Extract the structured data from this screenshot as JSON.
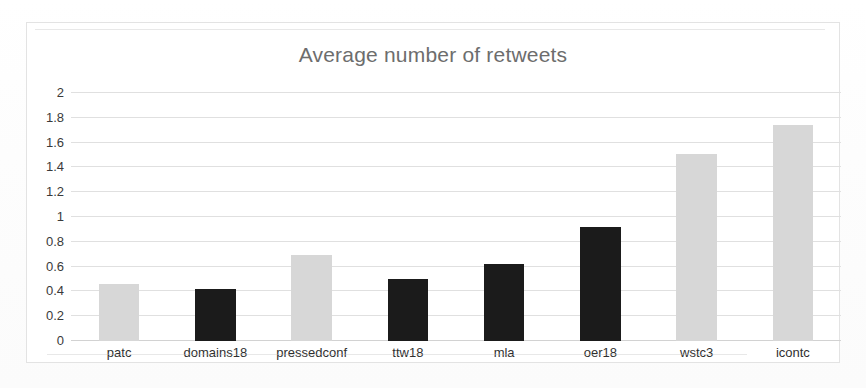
{
  "chart_data": {
    "type": "bar",
    "title": "Average number of retweets",
    "xlabel": "",
    "ylabel": "",
    "ylim": [
      0,
      2
    ],
    "ytick_step": 0.2,
    "grid": true,
    "legend": "none",
    "categories": [
      "patc",
      "domains18",
      "pressedconf",
      "ttw18",
      "mla",
      "oer18",
      "wstc3",
      "icontc"
    ],
    "values": [
      0.46,
      0.42,
      0.69,
      0.5,
      0.62,
      0.92,
      1.51,
      1.74
    ],
    "bar_colors": [
      "#d7d7d7",
      "#1b1b1b",
      "#d7d7d7",
      "#1b1b1b",
      "#1b1b1b",
      "#1b1b1b",
      "#d7d7d7",
      "#d7d7d7"
    ],
    "ytick_labels": [
      "2",
      "1.8",
      "1.6",
      "1.4",
      "1.2",
      "1",
      "0.8",
      "0.6",
      "0.4",
      "0.2",
      "0"
    ],
    "ytick_values": [
      2,
      1.8,
      1.6,
      1.4,
      1.2,
      1,
      0.8,
      0.6,
      0.4,
      0.2,
      0
    ],
    "colors": {
      "light_bar": "#d7d7d7",
      "dark_bar": "#1b1b1b",
      "gridline": "#e0e0e0",
      "title_text": "#6d6d6d",
      "axis_text": "#2f2f2f",
      "frame_border": "#e3e3e3",
      "background": "#ffffff"
    }
  }
}
